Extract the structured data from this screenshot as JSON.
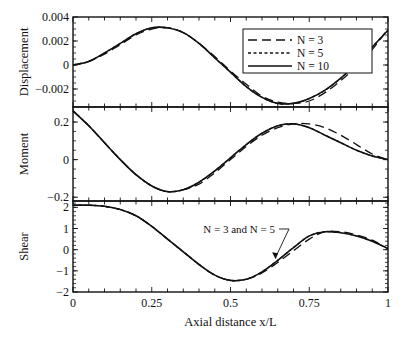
{
  "chart_data": {
    "type": "line",
    "xlabel": "Axial distance x/L",
    "xlim": [
      0,
      1
    ],
    "xticks": [
      "0",
      "0.25",
      "0.5",
      "0.75",
      "1"
    ],
    "legend": {
      "position": "upper right of top panel",
      "entries": [
        {
          "label": "N = 3",
          "style": "dashed"
        },
        {
          "label": "N = 5",
          "style": "dotted"
        },
        {
          "label": "N = 10",
          "style": "solid"
        }
      ]
    },
    "panels": [
      {
        "name": "Displacement",
        "ylabel": "Displacement",
        "ylim": [
          -0.0035,
          0.004
        ],
        "yticks": [
          "0.004",
          "0.002",
          "0",
          "-0.002"
        ],
        "x": [
          0,
          0.05,
          0.1,
          0.15,
          0.2,
          0.25,
          0.3,
          0.35,
          0.4,
          0.45,
          0.5,
          0.55,
          0.6,
          0.65,
          0.7,
          0.75,
          0.8,
          0.85,
          0.9,
          0.95,
          1.0
        ],
        "series": [
          {
            "name": "N = 3",
            "values": [
              0,
              0.0003,
              0.0009,
              0.0017,
              0.0025,
              0.003,
              0.0031,
              0.0027,
              0.0018,
              0.0007,
              -0.0005,
              -0.0016,
              -0.0026,
              -0.0031,
              -0.0032,
              -0.003,
              -0.0023,
              -0.0013,
              -0.0001,
              0.0013,
              0.003
            ]
          },
          {
            "name": "N = 5",
            "values": [
              0,
              0.0003,
              0.001,
              0.0018,
              0.0026,
              0.0031,
              0.0031,
              0.0027,
              0.0018,
              0.0006,
              -0.0006,
              -0.0018,
              -0.0027,
              -0.0032,
              -0.0032,
              -0.0028,
              -0.0021,
              -0.0011,
              0.0001,
              0.0015,
              0.0029
            ]
          },
          {
            "name": "N = 10",
            "values": [
              0,
              0.0003,
              0.001,
              0.0018,
              0.0026,
              0.0031,
              0.0031,
              0.0027,
              0.0018,
              0.0006,
              -0.0006,
              -0.0018,
              -0.0027,
              -0.0032,
              -0.0032,
              -0.0028,
              -0.0021,
              -0.0011,
              0.0001,
              0.0015,
              0.0029
            ]
          }
        ]
      },
      {
        "name": "Moment",
        "ylabel": "Moment",
        "ylim": [
          -0.22,
          0.28
        ],
        "yticks": [
          "0.2",
          "0",
          "-0.2"
        ],
        "x": [
          0,
          0.05,
          0.1,
          0.15,
          0.2,
          0.25,
          0.3,
          0.35,
          0.4,
          0.45,
          0.5,
          0.55,
          0.6,
          0.65,
          0.7,
          0.75,
          0.8,
          0.85,
          0.9,
          0.95,
          1.0
        ],
        "series": [
          {
            "name": "N = 3",
            "values": [
              0.26,
              0.18,
              0.09,
              0.0,
              -0.08,
              -0.14,
              -0.17,
              -0.16,
              -0.13,
              -0.07,
              0.0,
              0.07,
              0.13,
              0.17,
              0.19,
              0.19,
              0.17,
              0.13,
              0.08,
              0.03,
              0.0
            ]
          },
          {
            "name": "N = 5",
            "values": [
              0.26,
              0.18,
              0.09,
              0.0,
              -0.08,
              -0.14,
              -0.17,
              -0.16,
              -0.12,
              -0.06,
              0.01,
              0.08,
              0.14,
              0.18,
              0.19,
              0.17,
              0.13,
              0.09,
              0.05,
              0.02,
              0.0
            ]
          },
          {
            "name": "N = 10",
            "values": [
              0.26,
              0.18,
              0.09,
              0.0,
              -0.08,
              -0.14,
              -0.17,
              -0.16,
              -0.12,
              -0.06,
              0.01,
              0.08,
              0.14,
              0.18,
              0.19,
              0.17,
              0.13,
              0.09,
              0.05,
              0.02,
              0.0
            ]
          }
        ]
      },
      {
        "name": "Shear",
        "ylabel": "Shear",
        "ylim": [
          -2,
          2.3
        ],
        "yticks": [
          "2",
          "1",
          "0",
          "-1",
          "-2"
        ],
        "annotation": {
          "text": "N = 3 and N = 5",
          "arrow_to_x": 0.64
        },
        "x": [
          0,
          0.05,
          0.1,
          0.15,
          0.2,
          0.25,
          0.3,
          0.35,
          0.4,
          0.45,
          0.5,
          0.55,
          0.6,
          0.65,
          0.7,
          0.75,
          0.8,
          0.85,
          0.9,
          0.95,
          1.0
        ],
        "series": [
          {
            "name": "N = 3",
            "values": [
              2.1,
              2.1,
              2.05,
              1.9,
              1.6,
              1.1,
              0.5,
              -0.1,
              -0.7,
              -1.2,
              -1.45,
              -1.4,
              -1.1,
              -0.6,
              -0.05,
              0.5,
              0.85,
              0.85,
              0.7,
              0.45,
              0.05
            ]
          },
          {
            "name": "N = 5",
            "values": [
              2.1,
              2.1,
              2.05,
              1.9,
              1.6,
              1.1,
              0.5,
              -0.1,
              -0.7,
              -1.2,
              -1.45,
              -1.4,
              -1.05,
              -0.5,
              0.1,
              0.65,
              0.85,
              0.8,
              0.65,
              0.4,
              0.05
            ]
          },
          {
            "name": "N = 10",
            "values": [
              2.1,
              2.1,
              2.05,
              1.9,
              1.6,
              1.1,
              0.5,
              -0.1,
              -0.7,
              -1.2,
              -1.45,
              -1.4,
              -1.05,
              -0.5,
              0.1,
              0.65,
              0.85,
              0.8,
              0.65,
              0.4,
              0.05
            ]
          }
        ]
      }
    ]
  }
}
